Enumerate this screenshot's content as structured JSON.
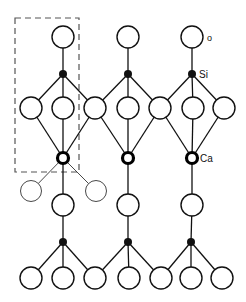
{
  "diagram": {
    "type": "crystal-structure",
    "labels": {
      "oxygen": "O",
      "silicon": "Si",
      "calcium": "Ca"
    },
    "colors": {
      "line": "#111111",
      "background": "#ffffff",
      "dashed_box": "#555555"
    },
    "atoms": {
      "top_oxygen": [
        [
          63,
          37
        ],
        [
          128,
          37
        ],
        [
          192,
          37
        ]
      ],
      "upper_silicon": [
        [
          63,
          74
        ],
        [
          128,
          74
        ],
        [
          192,
          74
        ]
      ],
      "upper_oxygen_row": [
        [
          31,
          108
        ],
        [
          63,
          108
        ],
        [
          95,
          108
        ],
        [
          128,
          108
        ],
        [
          160,
          108
        ],
        [
          193,
          108
        ],
        [
          224,
          108
        ]
      ],
      "calcium": [
        [
          63,
          158
        ],
        [
          128,
          158
        ],
        [
          192,
          158
        ]
      ],
      "side_oxygen_thin": [
        [
          31,
          191
        ],
        [
          96,
          191
        ]
      ],
      "middle_oxygen": [
        [
          63,
          205
        ],
        [
          128,
          205
        ],
        [
          192,
          205
        ]
      ],
      "lower_silicon": [
        [
          63,
          242
        ],
        [
          128,
          242
        ],
        [
          191,
          242
        ]
      ],
      "bottom_oxygen_row": [
        [
          31,
          278
        ],
        [
          63,
          278
        ],
        [
          95,
          278
        ],
        [
          129,
          278
        ],
        [
          161,
          278
        ],
        [
          191,
          278
        ],
        [
          222,
          278
        ]
      ]
    },
    "unit_cell_box": {
      "x": 15,
      "y": 18,
      "width": 64,
      "height": 154
    }
  }
}
